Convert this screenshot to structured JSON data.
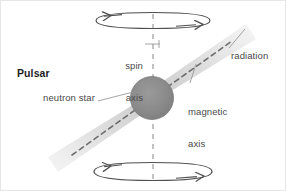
{
  "figure": {
    "title": "Pulsar",
    "background_color": "#ffffff",
    "border_color": "#e0e0e0",
    "labels": {
      "pulsar": "Pulsar",
      "neutron_star": "neutron star",
      "spin_axis_line1": "spin",
      "spin_axis_line2": "axis",
      "magnetic_axis_line1": "magnetic",
      "magnetic_axis_line2": "axis",
      "radiation": "radiation"
    },
    "colors": {
      "star_fill": "#8a8a8a",
      "star_edge": "#7c7c7c",
      "beam_fill": "#d9d9d9",
      "axis_dash": "#9a9a9a",
      "magnetic_dash": "#6e6e6e",
      "rotation_arrow": "#4f4f4f",
      "leader_line": "#9b9b9b",
      "text": "#4a4a4a",
      "text_bold": "#1d1d1d"
    },
    "elements": {
      "neutron_star": "neutron-star-sphere",
      "spin_axis": "spin-axis-dashed-line",
      "magnetic_axis": "magnetic-axis-dashed-line",
      "radiation_beam_upper": "radiation-beam-upper-right",
      "radiation_beam_lower": "radiation-beam-lower-left",
      "rotation_top": "rotation-ellipse-top",
      "rotation_bottom": "rotation-ellipse-bottom"
    }
  }
}
